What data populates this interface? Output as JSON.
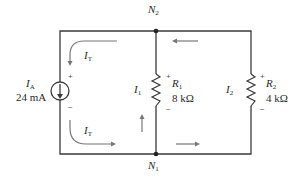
{
  "diagram": {
    "type": "circuit",
    "nodes": [
      {
        "name": "N",
        "sub": "2",
        "position": "top"
      },
      {
        "name": "N",
        "sub": "1",
        "position": "bottom"
      }
    ],
    "source": {
      "name": "I",
      "sub": "A",
      "value": "24 mA",
      "polarity_top": "+",
      "polarity_bottom": "−"
    },
    "resistors": [
      {
        "name": "R",
        "sub": "1",
        "value": "8 kΩ",
        "current": "I",
        "current_sub": "1",
        "polarity_top": "+",
        "polarity_bottom": "−"
      },
      {
        "name": "R",
        "sub": "2",
        "value": "4 kΩ",
        "current": "I",
        "current_sub": "2",
        "polarity_top": "+",
        "polarity_bottom": "−"
      }
    ],
    "total_current": {
      "name": "I",
      "sub": "T"
    },
    "colors": {
      "wire": "#3a3a3a",
      "arrow": "#777777",
      "text": "#2a2a2a"
    }
  }
}
